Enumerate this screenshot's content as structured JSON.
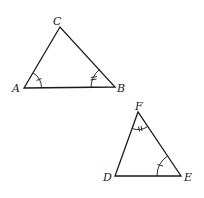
{
  "diagram": {
    "type": "congruent-triangles",
    "triangles": [
      {
        "name": "ABC",
        "vertices": {
          "A": {
            "label": "A",
            "x": 24,
            "y": 88
          },
          "B": {
            "label": "B",
            "x": 115,
            "y": 87
          },
          "C": {
            "label": "C",
            "x": 60,
            "y": 27
          }
        },
        "angle_marks": [
          {
            "vertex": "A",
            "ticks": 1
          },
          {
            "vertex": "B",
            "ticks": 2
          }
        ]
      },
      {
        "name": "DEF",
        "vertices": {
          "D": {
            "label": "D",
            "x": 115,
            "y": 176
          },
          "E": {
            "label": "E",
            "x": 181,
            "y": 176
          },
          "F": {
            "label": "F",
            "x": 138,
            "y": 112
          }
        },
        "angle_marks": [
          {
            "vertex": "F",
            "ticks": 2
          },
          {
            "vertex": "E",
            "ticks": 1
          }
        ]
      }
    ],
    "colors": {
      "stroke": "#1a1a1a",
      "background": "#ffffff"
    }
  }
}
